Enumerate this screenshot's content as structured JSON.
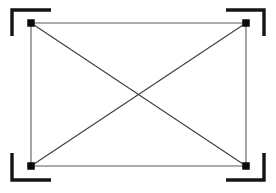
{
  "canvas": {
    "width": 276,
    "height": 193,
    "background_color": "#ffffff",
    "title": "Rectangle with diagonals and corner brackets"
  },
  "style": {
    "bracket_color": "#141414",
    "bracket_stroke_width": 3.4,
    "frame_edge_color": "#5a5a5a",
    "frame_edge_stroke_width": 1.1,
    "diagonal_color": "#3c3c3c",
    "diagonal_stroke_width": 1.1,
    "node_color": "#0a0a0a",
    "node_size": 7.5
  },
  "figure": {
    "nodes": [
      {
        "name": "node-top-left",
        "x": 31,
        "y": 23
      },
      {
        "name": "node-top-right",
        "x": 246,
        "y": 23
      },
      {
        "name": "node-bottom-right",
        "x": 246,
        "y": 166
      },
      {
        "name": "node-bottom-left",
        "x": 31,
        "y": 166
      }
    ],
    "frame_edges": [
      {
        "name": "frame-edge-top",
        "x1": 31,
        "y1": 23,
        "x2": 246,
        "y2": 23
      },
      {
        "name": "frame-edge-right",
        "x1": 246,
        "y1": 23,
        "x2": 246,
        "y2": 166
      },
      {
        "name": "frame-edge-bottom",
        "x1": 31,
        "y1": 166,
        "x2": 246,
        "y2": 166
      },
      {
        "name": "frame-edge-left",
        "x1": 31,
        "y1": 23,
        "x2": 31,
        "y2": 166
      }
    ],
    "diagonals": [
      {
        "name": "diagonal-tl-br",
        "x1": 31,
        "y1": 23,
        "x2": 246,
        "y2": 166
      },
      {
        "name": "diagonal-tr-bl",
        "x1": 246,
        "y1": 23,
        "x2": 31,
        "y2": 166
      }
    ],
    "diagonal_intersection": {
      "x": 138.5,
      "y": 94.5
    },
    "corner_brackets": [
      {
        "name": "corner-bracket-top-left",
        "points": "12,36 12,10 51,10",
        "orientation": "opens-down-right"
      },
      {
        "name": "corner-bracket-top-right",
        "points": "226,10 264,10 264,36",
        "orientation": "opens-down-left"
      },
      {
        "name": "corner-bracket-bottom-right",
        "points": "264,153 264,180 226,180",
        "orientation": "opens-up-left"
      },
      {
        "name": "corner-bracket-bottom-left",
        "points": "51,180 12,180 12,153",
        "orientation": "opens-up-right"
      }
    ]
  }
}
